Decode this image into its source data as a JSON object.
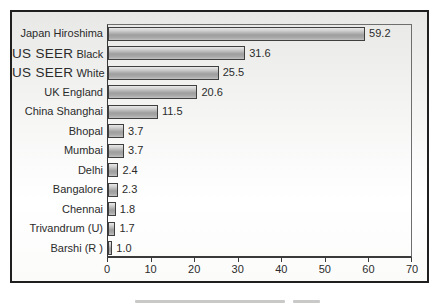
{
  "chart_data": {
    "type": "bar",
    "orientation": "horizontal",
    "title": "",
    "xlabel": "",
    "ylabel": "",
    "xlim": [
      0,
      70
    ],
    "xticks": [
      "0",
      "10",
      "20",
      "30",
      "40",
      "50",
      "60",
      "70"
    ],
    "grid": false,
    "legend": null,
    "bar_fill_color": "#b3b3b3",
    "bar_border_color": "#3f3f3f",
    "frame_border_color": "#1f1f1f",
    "categories": [
      "Japan Hiroshima",
      "US SEER Black",
      "US SEER White",
      "UK England",
      "China Shanghai",
      "Bhopal",
      "Mumbai",
      "Delhi",
      "Bangalore",
      "Chennai",
      "Trivandrum (U)",
      "Barshi (R )"
    ],
    "values": [
      59.2,
      31.6,
      25.5,
      20.6,
      11.5,
      3.7,
      3.7,
      2.4,
      2.3,
      1.8,
      1.7,
      1.0
    ],
    "rows": [
      {
        "label_emph": "",
        "label": "Japan Hiroshima",
        "value": 59.2,
        "value_label": "59.2"
      },
      {
        "label_emph": "US SEER",
        "label": "Black",
        "value": 31.6,
        "value_label": "31.6"
      },
      {
        "label_emph": "US SEER",
        "label": "White",
        "value": 25.5,
        "value_label": "25.5"
      },
      {
        "label_emph": "",
        "label": "UK England",
        "value": 20.6,
        "value_label": "20.6"
      },
      {
        "label_emph": "",
        "label": "China Shanghai",
        "value": 11.5,
        "value_label": "11.5"
      },
      {
        "label_emph": "",
        "label": "Bhopal",
        "value": 3.7,
        "value_label": "3.7"
      },
      {
        "label_emph": "",
        "label": "Mumbai",
        "value": 3.7,
        "value_label": "3.7"
      },
      {
        "label_emph": "",
        "label": "Delhi",
        "value": 2.4,
        "value_label": "2.4"
      },
      {
        "label_emph": "",
        "label": "Bangalore",
        "value": 2.3,
        "value_label": "2.3"
      },
      {
        "label_emph": "",
        "label": "Chennai",
        "value": 1.8,
        "value_label": "1.8"
      },
      {
        "label_emph": "",
        "label": "Trivandrum (U)",
        "value": 1.7,
        "value_label": "1.7"
      },
      {
        "label_emph": "",
        "label": "Barshi (R )",
        "value": 1.0,
        "value_label": "1.0"
      }
    ]
  }
}
